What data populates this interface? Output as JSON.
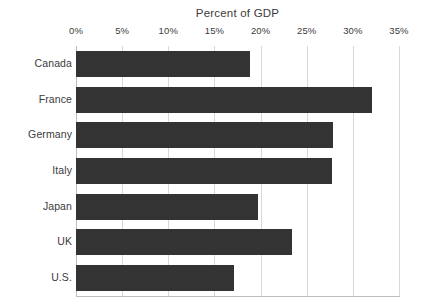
{
  "chart_data": {
    "type": "bar",
    "orientation": "horizontal",
    "title": "Percent of GDP",
    "xlabel": "",
    "ylabel": "",
    "categories": [
      "Canada",
      "France",
      "Germany",
      "Italy",
      "Japan",
      "UK",
      "U.S."
    ],
    "values": [
      18.9,
      32.1,
      27.8,
      27.7,
      19.7,
      23.4,
      17.1
    ],
    "xlim": [
      0,
      35
    ],
    "xtick_values": [
      0,
      5,
      10,
      15,
      20,
      25,
      30,
      35
    ],
    "xtick_labels": [
      "0%",
      "5%",
      "10%",
      "15%",
      "20%",
      "25%",
      "30%",
      "35%"
    ],
    "grid": true,
    "grid_axis": "x",
    "legend": false,
    "legend_position": "none",
    "bar_color": "#333333",
    "gridline_color": "#d8d8d8",
    "axis_color": "#bdbdbd",
    "background_color": "#ffffff",
    "text_color": "#3b3b3b"
  }
}
